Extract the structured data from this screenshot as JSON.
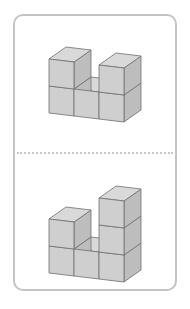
{
  "figure": {
    "type": "isometric-cube-arrangement-comparison",
    "colors": {
      "front": "#cfcfcf",
      "top": "#d9d9d9",
      "side": "#bdbdbd",
      "edge": "#6e6e6e",
      "card_border": "#c4c4c4",
      "divider": "#c8c8c8"
    },
    "panels": [
      {
        "label": "top-figure",
        "column_heights": [
          2,
          1,
          2
        ]
      },
      {
        "label": "bottom-figure",
        "column_heights": [
          2,
          1,
          3
        ]
      }
    ]
  }
}
